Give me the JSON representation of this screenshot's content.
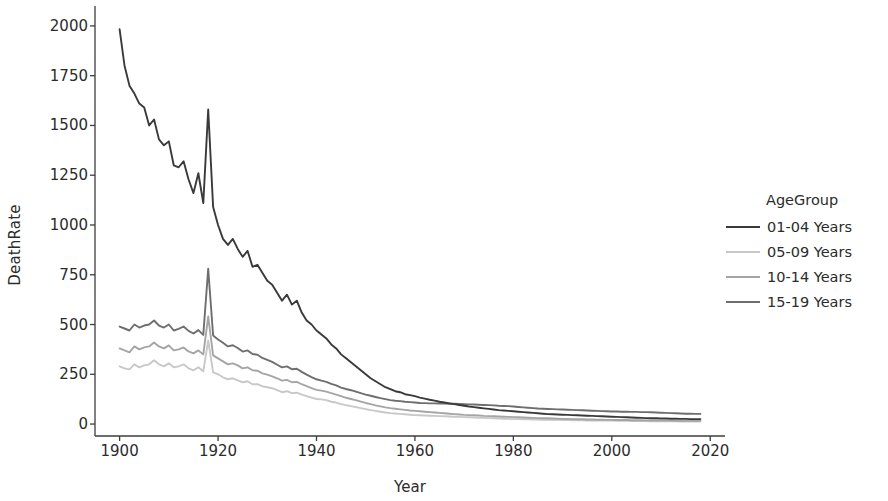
{
  "chart_data": {
    "type": "line",
    "title": "",
    "xlabel": "Year",
    "ylabel": "DeathRate",
    "xlim": [
      1895,
      2023
    ],
    "ylim": [
      -60,
      2080
    ],
    "xticks": [
      1900,
      1920,
      1940,
      1960,
      1980,
      2000,
      2020
    ],
    "yticks": [
      0,
      250,
      500,
      750,
      1000,
      1250,
      1500,
      1750,
      2000
    ],
    "grid": false,
    "legend_title": "AgeGroup",
    "legend_position": "right",
    "x": [
      1900,
      1901,
      1902,
      1903,
      1904,
      1905,
      1906,
      1907,
      1908,
      1909,
      1910,
      1911,
      1912,
      1913,
      1914,
      1915,
      1916,
      1917,
      1918,
      1919,
      1920,
      1921,
      1922,
      1923,
      1924,
      1925,
      1926,
      1927,
      1928,
      1929,
      1930,
      1931,
      1932,
      1933,
      1934,
      1935,
      1936,
      1937,
      1938,
      1939,
      1940,
      1941,
      1942,
      1943,
      1944,
      1945,
      1946,
      1947,
      1948,
      1949,
      1950,
      1951,
      1952,
      1953,
      1954,
      1955,
      1956,
      1957,
      1958,
      1959,
      1960,
      1961,
      1962,
      1963,
      1964,
      1965,
      1966,
      1967,
      1968,
      1969,
      1970,
      1971,
      1972,
      1973,
      1974,
      1975,
      1976,
      1977,
      1978,
      1979,
      1980,
      1981,
      1982,
      1983,
      1984,
      1985,
      1986,
      1987,
      1988,
      1989,
      1990,
      1991,
      1992,
      1993,
      1994,
      1995,
      1996,
      1997,
      1998,
      1999,
      2000,
      2001,
      2002,
      2003,
      2004,
      2005,
      2006,
      2007,
      2008,
      2009,
      2010,
      2011,
      2012,
      2013,
      2014,
      2015,
      2016,
      2017,
      2018
    ],
    "series": [
      {
        "name": "01-04 Years",
        "color": "#3a3a3a",
        "values": [
          1983,
          1800,
          1700,
          1660,
          1610,
          1590,
          1500,
          1530,
          1430,
          1400,
          1420,
          1300,
          1290,
          1320,
          1230,
          1160,
          1260,
          1110,
          1580,
          1090,
          1000,
          930,
          900,
          930,
          880,
          840,
          870,
          790,
          800,
          760,
          720,
          700,
          660,
          620,
          650,
          600,
          620,
          560,
          520,
          500,
          470,
          450,
          430,
          400,
          380,
          350,
          330,
          310,
          290,
          270,
          250,
          230,
          215,
          200,
          185,
          175,
          165,
          160,
          150,
          145,
          140,
          133,
          128,
          122,
          118,
          112,
          108,
          104,
          100,
          96,
          92,
          88,
          85,
          82,
          79,
          76,
          73,
          70,
          68,
          66,
          64,
          62,
          60,
          58,
          56,
          54,
          52,
          50,
          49,
          48,
          47,
          46,
          45,
          44,
          43,
          42,
          41,
          40,
          39,
          38,
          37,
          36,
          35,
          34,
          33,
          32,
          31,
          30,
          29,
          29,
          28,
          28,
          27,
          27,
          26,
          26,
          25,
          25,
          25
        ]
      },
      {
        "name": "05-09 Years",
        "color": "#c8c8c8",
        "values": [
          290,
          280,
          275,
          300,
          285,
          295,
          300,
          320,
          300,
          290,
          305,
          285,
          290,
          300,
          280,
          270,
          285,
          265,
          420,
          260,
          250,
          235,
          225,
          230,
          220,
          210,
          215,
          200,
          200,
          190,
          185,
          180,
          170,
          160,
          165,
          155,
          158,
          148,
          140,
          133,
          126,
          124,
          120,
          112,
          108,
          100,
          95,
          90,
          85,
          80,
          75,
          70,
          66,
          62,
          58,
          55,
          53,
          51,
          49,
          47,
          45,
          44,
          43,
          42,
          41,
          40,
          39,
          38,
          37,
          36,
          35,
          34,
          33,
          32,
          31,
          30,
          29,
          28,
          27,
          26,
          25,
          25,
          24,
          24,
          23,
          23,
          22,
          22,
          21,
          21,
          20,
          20,
          19,
          19,
          19,
          18,
          18,
          18,
          17,
          17,
          17,
          16,
          16,
          16,
          15,
          15,
          15,
          15,
          14,
          14,
          14,
          14,
          14,
          14,
          13,
          13,
          13,
          13,
          13
        ]
      },
      {
        "name": "10-14 Years",
        "color": "#a5a5a5",
        "values": [
          380,
          370,
          360,
          390,
          375,
          385,
          390,
          410,
          390,
          380,
          395,
          370,
          375,
          385,
          365,
          355,
          370,
          350,
          540,
          345,
          330,
          315,
          300,
          305,
          295,
          280,
          285,
          270,
          268,
          255,
          248,
          240,
          230,
          218,
          222,
          210,
          212,
          200,
          190,
          180,
          172,
          168,
          163,
          155,
          148,
          140,
          132,
          126,
          120,
          113,
          106,
          100,
          94,
          89,
          84,
          80,
          77,
          74,
          71,
          68,
          66,
          64,
          62,
          60,
          58,
          56,
          54,
          52,
          50,
          48,
          46,
          45,
          44,
          43,
          41,
          40,
          39,
          38,
          37,
          36,
          35,
          34,
          33,
          32,
          31,
          30,
          29,
          29,
          28,
          27,
          26,
          26,
          25,
          24,
          24,
          23,
          23,
          22,
          22,
          21,
          21,
          20,
          20,
          20,
          19,
          19,
          19,
          18,
          18,
          18,
          17,
          17,
          17,
          16,
          16,
          16,
          16,
          16,
          16
        ]
      },
      {
        "name": "15-19 Years",
        "color": "#6e6e6e",
        "values": [
          490,
          480,
          470,
          500,
          485,
          495,
          500,
          520,
          495,
          485,
          500,
          470,
          478,
          490,
          468,
          455,
          472,
          448,
          780,
          445,
          425,
          408,
          390,
          396,
          382,
          364,
          370,
          352,
          348,
          332,
          322,
          312,
          298,
          285,
          290,
          275,
          278,
          262,
          248,
          236,
          225,
          218,
          212,
          202,
          194,
          183,
          176,
          170,
          163,
          155,
          148,
          142,
          136,
          130,
          125,
          120,
          117,
          115,
          112,
          110,
          108,
          106,
          105,
          104,
          104,
          103,
          103,
          102,
          102,
          101,
          100,
          99,
          98,
          97,
          96,
          95,
          94,
          92,
          91,
          90,
          88,
          86,
          84,
          82,
          80,
          78,
          77,
          76,
          75,
          74,
          73,
          72,
          71,
          70,
          69,
          68,
          67,
          66,
          65,
          64,
          63,
          63,
          62,
          62,
          61,
          61,
          60,
          60,
          59,
          58,
          57,
          56,
          55,
          54,
          53,
          52,
          52,
          51,
          51
        ]
      }
    ]
  },
  "legend": {
    "title": "AgeGroup",
    "items": [
      {
        "label": "01-04 Years",
        "color": "#3a3a3a"
      },
      {
        "label": "05-09 Years",
        "color": "#c8c8c8"
      },
      {
        "label": "10-14 Years",
        "color": "#a5a5a5"
      },
      {
        "label": "15-19 Years",
        "color": "#6e6e6e"
      }
    ]
  },
  "axes": {
    "x_label": "Year",
    "y_label": "DeathRate",
    "x_tick_labels": [
      "1900",
      "1920",
      "1940",
      "1960",
      "1980",
      "2000",
      "2020"
    ],
    "y_tick_labels": [
      "0",
      "250",
      "500",
      "750",
      "1000",
      "1250",
      "1500",
      "1750",
      "2000"
    ]
  },
  "colors": {
    "background": "#ffffff",
    "axis": "#3d3d3d",
    "text": "#2b2b2b"
  }
}
